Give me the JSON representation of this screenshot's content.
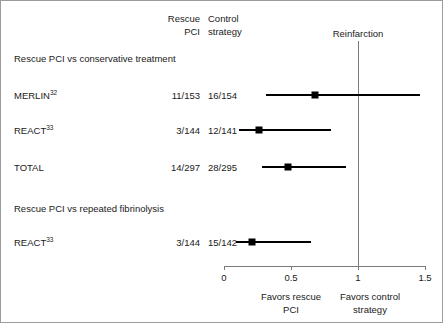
{
  "figure": {
    "outcome_label": "Reinfarction",
    "columns": {
      "treatment_line1": "Rescue",
      "treatment_line2": "PCI",
      "control_line1": "Control",
      "control_line2": "strategy"
    }
  },
  "sections": [
    {
      "heading": "Rescue PCI vs conservative treatment",
      "rows": [
        {
          "study": "MERLIN",
          "footnote": "32",
          "treatment_events": "11/153",
          "control_events": "16/154",
          "rr": 0.68,
          "ci_low": 0.31,
          "ci_high": 1.46
        },
        {
          "study": "REACT",
          "footnote": "33",
          "treatment_events": "3/144",
          "control_events": "12/141",
          "rr": 0.26,
          "ci_low": 0.11,
          "ci_high": 0.8
        },
        {
          "study": "TOTAL",
          "footnote": "",
          "treatment_events": "14/297",
          "control_events": "28/295",
          "rr": 0.48,
          "ci_low": 0.28,
          "ci_high": 0.91
        }
      ]
    },
    {
      "heading": "Rescue PCI vs repeated fibrinolysis",
      "rows": [
        {
          "study": "REACT",
          "footnote": "33",
          "treatment_events": "3/144",
          "control_events": "15/142",
          "rr": 0.21,
          "ci_low": 0.09,
          "ci_high": 0.65
        }
      ]
    }
  ],
  "axis": {
    "ticks": [
      "0",
      "0.5",
      "1",
      "1.5"
    ],
    "tick_values": [
      0,
      0.5,
      1,
      1.5
    ],
    "min": 0,
    "max": 1.5,
    "null_value": 1,
    "favors_left_line1": "Favors rescue",
    "favors_left_line2": "PCI",
    "favors_right_line1": "Favors control",
    "favors_right_line2": "strategy"
  },
  "chart_data": {
    "type": "forest",
    "title": "Reinfarction",
    "xlabel": "Risk ratio",
    "xlim": [
      0,
      1.5
    ],
    "xticks": [
      0,
      0.5,
      1,
      1.5
    ],
    "null_line": 1,
    "groups": [
      {
        "name": "Rescue PCI vs conservative treatment",
        "entries": [
          {
            "label": "MERLIN32",
            "treatment": "11/153",
            "control": "16/154",
            "estimate": 0.68,
            "ci": [
              0.31,
              1.46
            ]
          },
          {
            "label": "REACT33",
            "treatment": "3/144",
            "control": "12/141",
            "estimate": 0.26,
            "ci": [
              0.11,
              0.8
            ]
          },
          {
            "label": "TOTAL",
            "treatment": "14/297",
            "control": "28/295",
            "estimate": 0.48,
            "ci": [
              0.28,
              0.91
            ]
          }
        ]
      },
      {
        "name": "Rescue PCI vs repeated fibrinolysis",
        "entries": [
          {
            "label": "REACT33",
            "treatment": "3/144",
            "control": "15/142",
            "estimate": 0.21,
            "ci": [
              0.09,
              0.65
            ]
          }
        ]
      }
    ]
  }
}
